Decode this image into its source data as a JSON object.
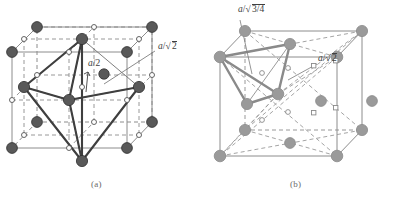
{
  "figure": {
    "type": "crystal-structure-diagram",
    "background": "#ffffff"
  },
  "panels": [
    {
      "id": "a",
      "caption": "(a)",
      "site": "octahedral",
      "atom_color": "#595959",
      "atom_edge": "#2e2e2e",
      "interstitial_marker": "open-circle",
      "labels": [
        {
          "name": "half-a",
          "text": "a/2",
          "italic_part": "a",
          "x": 88,
          "y": 64
        },
        {
          "name": "a-over-root-2",
          "text": "a/√2",
          "base": "a/",
          "radicand": "2",
          "x": 157,
          "y": 48
        }
      ]
    },
    {
      "id": "b",
      "caption": "(b)",
      "site": "tetrahedral",
      "atom_color": "#9a9a9a",
      "atom_edge": "#8a8a8a",
      "interstitial_marker": "open-circle-and-square",
      "labels": [
        {
          "name": "a-over-root-three-quarters",
          "text": "a/√(3/4)",
          "base": "a/",
          "radicand": "3/4",
          "x": 238,
          "y": 8
        },
        {
          "name": "a-over-root-2",
          "text": "a/√2",
          "base": "a/",
          "radicand": "2",
          "x": 318,
          "y": 58
        }
      ]
    }
  ],
  "captions": {
    "left": "(a)",
    "right": "(b)"
  },
  "colors": {
    "cube_solid": "#8c8c8c",
    "cube_dashed": "#8c8c8c",
    "polyhedron_a": "#4a4a4a",
    "polyhedron_b": "#8a8a8a",
    "label_text": "#404040",
    "caption_text": "#6a6a6a"
  }
}
